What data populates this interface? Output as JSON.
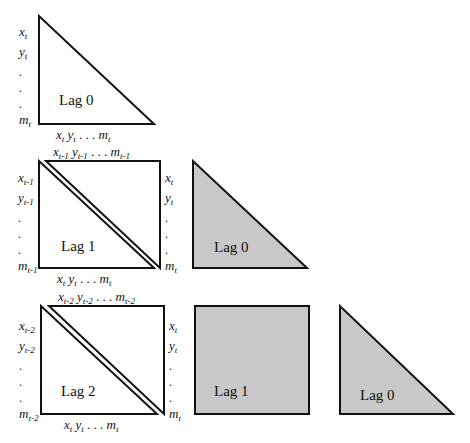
{
  "colors": {
    "stroke": "#111111",
    "shaded_fill": "#c8c8c8",
    "background": "#ffffff"
  },
  "rows": [
    {
      "name": "lag0-block",
      "shapes": [
        {
          "type": "triangle",
          "label": "Lag 0",
          "shaded": false
        }
      ],
      "left_labels": [
        "x",
        "y",
        ".",
        ".",
        ".",
        "m"
      ],
      "left_subscript": "t",
      "bottom_label": {
        "x": "x",
        "y": "y",
        "dots": ". . .",
        "m": "m",
        "sub": "t"
      }
    },
    {
      "name": "lag1-block",
      "shapes": [
        {
          "type": "square-split",
          "label": "Lag 1",
          "shaded": false
        },
        {
          "type": "triangle",
          "label": "Lag 0",
          "shaded": true
        }
      ],
      "left_labels": [
        "x",
        "y",
        ".",
        ".",
        ".",
        "m"
      ],
      "left_subscript": "t-1",
      "right_labels": [
        "x",
        "y",
        ".",
        ".",
        ".",
        "m"
      ],
      "right_subscript": "t",
      "top_label": {
        "x": "x",
        "y": "y",
        "dots": ". . .",
        "m": "m",
        "sub": "t-1"
      },
      "bottom_label": {
        "x": "x",
        "y": "y",
        "dots": ". . .",
        "m": "m",
        "sub": "t"
      }
    },
    {
      "name": "lag2-block",
      "shapes": [
        {
          "type": "square-split",
          "label": "Lag 2",
          "shaded": false
        },
        {
          "type": "square",
          "label": "Lag 1",
          "shaded": true
        },
        {
          "type": "triangle",
          "label": "Lag 0",
          "shaded": true
        }
      ],
      "left_labels": [
        "x",
        "y",
        ".",
        ".",
        ".",
        "m"
      ],
      "left_subscript": "t-2",
      "right_labels": [
        "x",
        "y",
        ".",
        ".",
        ".",
        "m"
      ],
      "right_subscript": "t",
      "top_label": {
        "x": "x",
        "y": "y",
        "dots": ". . .",
        "m": "m",
        "sub": "t-2"
      },
      "bottom_label": {
        "x": "x",
        "y": "y",
        "dots": ". . .",
        "m": "m",
        "sub": "t"
      }
    }
  ]
}
